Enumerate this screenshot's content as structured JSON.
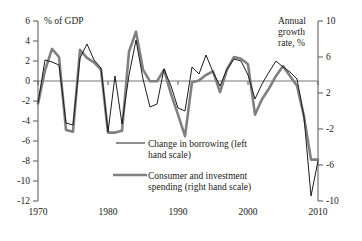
{
  "chart_data": {
    "type": "line",
    "title": "",
    "subtitle": "",
    "xlabel": "",
    "ylabel": "% of GDP",
    "y2label": "Annual growth rate, %",
    "grid": false,
    "legend_position": "center",
    "xlim": [
      1970,
      2010
    ],
    "ylim": [
      -12,
      6
    ],
    "y2lim": [
      -10,
      10
    ],
    "xticks": [
      "1970",
      "1980",
      "1990",
      "2000",
      "2010"
    ],
    "xtick_values": [
      1970,
      1980,
      1990,
      2000,
      2010
    ],
    "yticks": [
      "6",
      "4",
      "2",
      "0",
      "-2",
      "-4",
      "-6",
      "-8",
      "-10",
      "-12"
    ],
    "ytick_values": [
      6,
      4,
      2,
      0,
      -2,
      -4,
      -6,
      -8,
      -10,
      -12
    ],
    "y2ticks": [
      "10",
      "6",
      "2",
      "-2",
      "-6",
      "-10"
    ],
    "y2tick_values": [
      10,
      6,
      2,
      -2,
      -6,
      -10
    ],
    "zero_line": 0,
    "x": [
      1970,
      1971,
      1972,
      1973,
      1974,
      1975,
      1976,
      1977,
      1978,
      1979,
      1980,
      1981,
      1982,
      1983,
      1984,
      1985,
      1986,
      1987,
      1988,
      1989,
      1990,
      1991,
      1992,
      1993,
      1994,
      1995,
      1996,
      1997,
      1998,
      1999,
      2000,
      2001,
      2002,
      2003,
      2004,
      2005,
      2006,
      2007,
      2008,
      2009,
      2010
    ],
    "series": [
      {
        "name": "Change in borrowing (left hand scale)",
        "axis": "left",
        "color": "#1c1c1c",
        "style": "thin-line",
        "values": [
          -2.2,
          2.1,
          1.9,
          1.6,
          -4.2,
          -4.4,
          2.3,
          3.7,
          2.1,
          1.3,
          -5.1,
          0.5,
          -4.3,
          0.6,
          4.1,
          0.2,
          -2.6,
          -2.3,
          1.2,
          -0.5,
          -2.7,
          -3.0,
          1.4,
          0.7,
          2.6,
          0.9,
          -0.5,
          1.2,
          2.2,
          2.0,
          0.6,
          -1.8,
          -0.3,
          0.9,
          2.0,
          1.4,
          0.9,
          0.2,
          -3.6,
          -11.5,
          -8.0
        ]
      },
      {
        "name": "Consumer and investment spending (right hand scale)",
        "axis": "right",
        "color": "#808080",
        "style": "thick-line",
        "values": [
          0.8,
          4.5,
          6.9,
          6.0,
          -2.1,
          -2.3,
          6.8,
          5.9,
          5.4,
          4.6,
          -2.4,
          -2.4,
          -2.2,
          6.6,
          8.8,
          4.6,
          3.3,
          3.3,
          4.6,
          1.9,
          -0.4,
          -2.8,
          3.2,
          3.4,
          4.0,
          4.4,
          2.1,
          4.6,
          6.0,
          5.8,
          5.2,
          -0.4,
          1.3,
          2.5,
          3.9,
          5.0,
          3.9,
          2.8,
          -0.6,
          -5.4,
          -5.4
        ]
      }
    ],
    "annotations": []
  },
  "axes": {
    "left_caption": "% of GDP",
    "right_caption_lines": [
      "Annual",
      "growth",
      "rate, %"
    ]
  },
  "legend": {
    "items": [
      {
        "label_lines": [
          "Change in borrowing (left",
          "hand scale)"
        ],
        "swatch": "thin-black-line"
      },
      {
        "label_lines": [
          "Consumer and investment",
          "spending (right hand scale)"
        ],
        "swatch": "thick-grey-line"
      }
    ]
  }
}
